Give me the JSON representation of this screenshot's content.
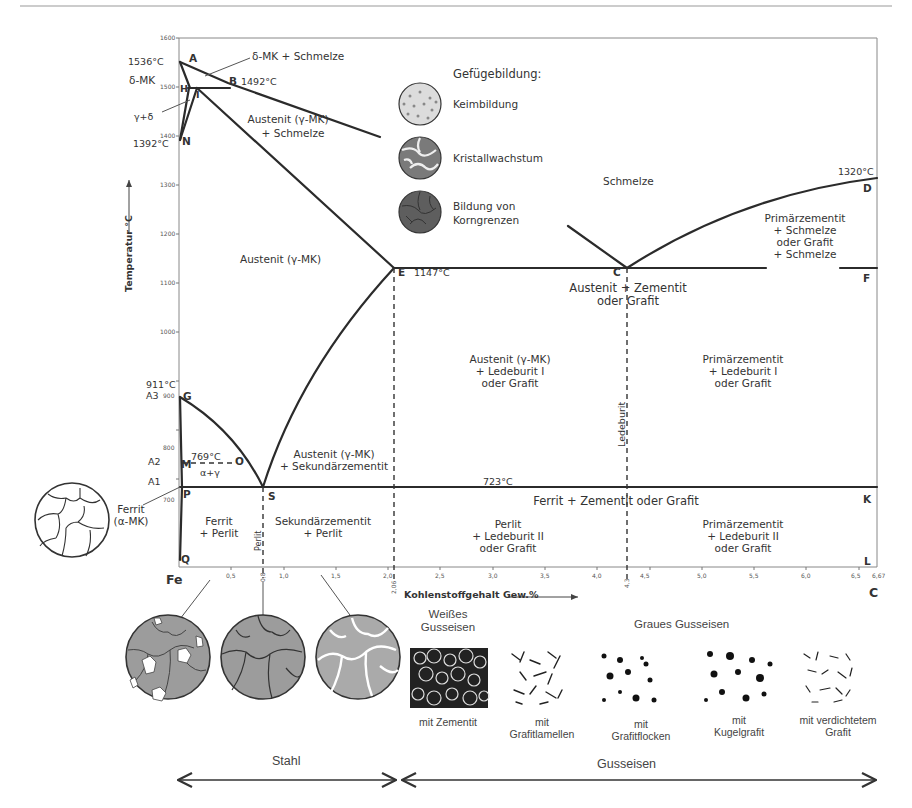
{
  "figure": {
    "top_rule": true
  },
  "axes": {
    "ylabel": "Temperatur °C",
    "xlabel": "Kohlenstoffgehalt Gew.%",
    "y_ticks": [
      "1600",
      "1500",
      "1400",
      "1300",
      "1200",
      "1100",
      "1000",
      "900",
      "800",
      "700"
    ],
    "x_ticks": [
      "0,5",
      "0,8",
      "1,0",
      "1,5",
      "2,0",
      "2,5",
      "3,0",
      "3,5",
      "4,0",
      "4,3",
      "4,5",
      "5,0",
      "5,5",
      "6,0",
      "6,5",
      "6,67"
    ],
    "x_special": [
      "2,06",
      "4,3"
    ],
    "origin_label": "Fe",
    "end_label": "C"
  },
  "points": {
    "A": "A",
    "B": "B",
    "H": "H",
    "I": "I",
    "N": "N",
    "E": "E",
    "C": "C",
    "D": "D",
    "F": "F",
    "G": "G",
    "M": "M",
    "O": "O",
    "P": "P",
    "S": "S",
    "K": "K",
    "Q": "Q",
    "L": "L"
  },
  "temps": {
    "t1536": "1536°C",
    "t1492": "1492°C",
    "t1392": "1392°C",
    "t1320": "1320°C",
    "t1147": "1147°C",
    "t911": "911°C",
    "t769": "769°C",
    "t723": "723°C",
    "A3": "A3",
    "A2": "A2",
    "A1": "A1"
  },
  "regions": {
    "delta_schmelze": "δ-MK + Schmelze",
    "delta_mk": "δ-MK",
    "gamma_delta": "γ+δ",
    "austenit_schmelze_1": "Austenit (γ-MK)",
    "austenit_schmelze_2": "+ Schmelze",
    "schmelze": "Schmelze",
    "austenit": "Austenit (γ-MK)",
    "primaer_schmelze": [
      "Primärzementit",
      "+ Schmelze",
      "oder Grafit",
      "+ Schmelze"
    ],
    "aust_zement": [
      "Austenit + Zementit",
      "oder Grafit"
    ],
    "aust_led1": [
      "Austenit (γ-MK)",
      "+ Ledeburit I",
      "oder Grafit"
    ],
    "prim_led1": [
      "Primärzementit",
      "+ Ledeburit I",
      "oder Grafit"
    ],
    "ledeburit": "Ledeburit",
    "aust_sek": [
      "Austenit (γ-MK)",
      "+ Sekundärzementit"
    ],
    "alpha_gamma": "α+γ",
    "ferrit": [
      "Ferrit",
      "(α-MK)"
    ],
    "ferrit_zement": "Ferrit + Zementit oder Grafit",
    "ferrit_perlit": [
      "Ferrit",
      "+ Perlit"
    ],
    "perlit_vert": "Perlit",
    "sek_perlit": [
      "Sekundärzementit",
      "+ Perlit"
    ],
    "perlit_led2": [
      "Perlit",
      "+ Ledeburit II",
      "oder Grafit"
    ],
    "prim_led2": [
      "Primärzementit",
      "+ Ledeburit II",
      "oder Grafit"
    ]
  },
  "legend": {
    "title": "Gefügebildung:",
    "items": [
      "Keimbildung",
      "Kristallwachstum",
      "Bildung von",
      "Korngrenzen"
    ]
  },
  "cast_iron": {
    "white_title": [
      "Weißes",
      "Gusseisen"
    ],
    "grey_title": "Graues Gusseisen",
    "captions": [
      [
        "mit Zementit"
      ],
      [
        "mit",
        "Grafitlamellen"
      ],
      [
        "mit",
        "Grafitflocken"
      ],
      [
        "mit",
        "Kugelgrafit"
      ],
      [
        "mit verdichtetem",
        "Grafit"
      ]
    ]
  },
  "ranges": {
    "stahl": "Stahl",
    "gusseisen": "Gusseisen"
  },
  "colors": {
    "line": "#2b2b2b",
    "grain_fill": "#9a9a9a",
    "nucleation_fill": "#d8d8d8",
    "boundary_fill": "#6a6a6a"
  }
}
